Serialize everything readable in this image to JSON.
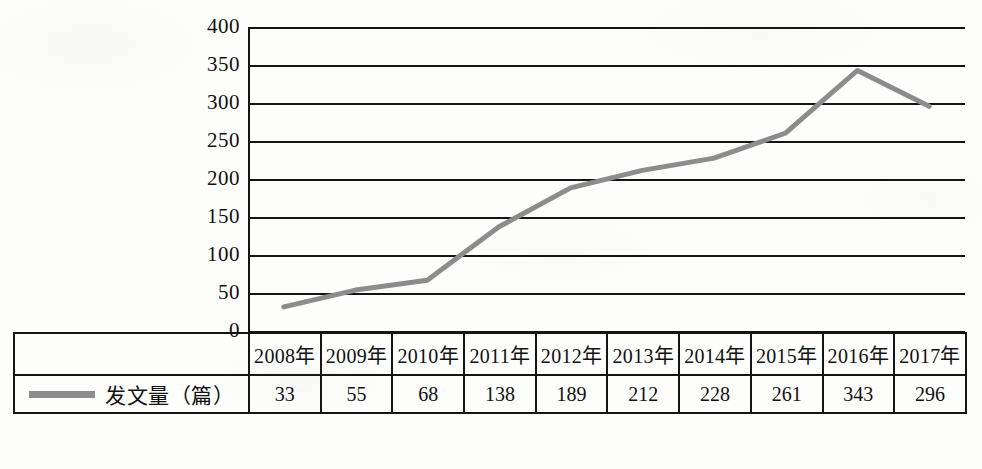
{
  "chart_data": {
    "type": "line",
    "title": "",
    "xlabel": "",
    "ylabel": "",
    "categories": [
      "2008年",
      "2009年",
      "2010年",
      "2011年",
      "2012年",
      "2013年",
      "2014年",
      "2015年",
      "2016年",
      "2017年"
    ],
    "series": [
      {
        "name": "发文量（篇）",
        "values": [
          33,
          55,
          68,
          138,
          189,
          212,
          228,
          261,
          343,
          296
        ],
        "color": "#8c8c8c"
      }
    ],
    "ylim": [
      0,
      400
    ],
    "y_ticks": [
      400,
      350,
      300,
      250,
      200,
      150,
      100,
      50,
      0
    ],
    "y_tick_labels": [
      "400",
      "350",
      "300",
      "250",
      "200",
      "150",
      "100",
      "50",
      "0"
    ],
    "grid": true,
    "legend_position": "bottom-left-table"
  },
  "table": {
    "legend_label": "发文量（篇）",
    "legend_swatch_color": "#8c8c8c",
    "year_row": [
      "2008年",
      "2009年",
      "2010年",
      "2011年",
      "2012年",
      "2013年",
      "2014年",
      "2015年",
      "2016年",
      "2017年"
    ],
    "value_row": [
      "33",
      "55",
      "68",
      "138",
      "189",
      "212",
      "228",
      "261",
      "343",
      "296"
    ]
  },
  "axis": {
    "y_labels": [
      "400",
      "350",
      "300",
      "250",
      "200",
      "150",
      "100",
      "50",
      "0"
    ]
  },
  "colors": {
    "line": "#8c8c8c",
    "axis": "#141414",
    "background": "#fdfdfc"
  }
}
